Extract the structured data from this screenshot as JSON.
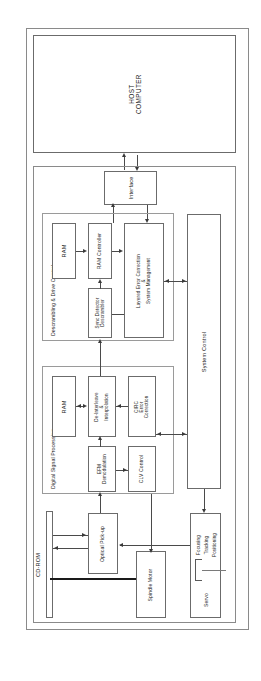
{
  "diagram": {
    "orientation": "rotated-90",
    "host": {
      "label": "HOST\nCOMPUTER",
      "line1": "HOST",
      "line2": "COMPUTER"
    },
    "interface": {
      "label": "Interface"
    },
    "groups": {
      "descrambling": {
        "label": "Descrambling & Drive Control"
      },
      "dsp": {
        "label": "Digital Signal Processing"
      }
    },
    "blocks": {
      "ram_top": {
        "label": "RAM"
      },
      "ram_controller": {
        "label": "RAM Controller"
      },
      "sync_detector": {
        "line1": "Sync Detector",
        "line2": "Descrambler"
      },
      "layered_error": {
        "line1": "Layered Error Correction",
        "line2": "&",
        "line3": "System Management"
      },
      "system_control": {
        "label": "System Control"
      },
      "ram_dsp": {
        "label": "RAM"
      },
      "deinterleave": {
        "line1": "De-Interleave",
        "line2": "&",
        "line3": "Interpolation"
      },
      "circ": {
        "line1": "CIRC",
        "line2": "Error",
        "line3": "Correction"
      },
      "efm": {
        "line1": "EFM",
        "line2": "Demodulation"
      },
      "clv": {
        "label": "CLV Control"
      },
      "optical_pickup": {
        "label": "Optical Pick-up"
      },
      "spindle_motor": {
        "label": "Spindle Motor"
      },
      "servo": {
        "label": "Servo",
        "items": [
          "Focusing",
          "Tracking",
          "Positioning"
        ]
      },
      "cdrom": {
        "label": "CD-ROM"
      }
    },
    "colors": {
      "box_border": "#6b6b6b",
      "group_border": "#9a9a9a",
      "line": "#4a4a4a",
      "belt": "#1a1a1a",
      "background": "#ffffff"
    }
  }
}
